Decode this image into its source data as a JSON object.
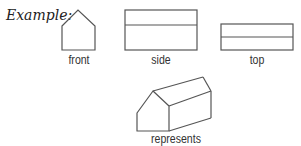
{
  "intro_label": "Example:",
  "views": [
    {
      "id": "front",
      "label": "front"
    },
    {
      "id": "side",
      "label": "side"
    },
    {
      "id": "top",
      "label": "top"
    }
  ],
  "result": {
    "label": "represents"
  },
  "colors": {
    "stroke": "#555555",
    "text": "#333333"
  }
}
